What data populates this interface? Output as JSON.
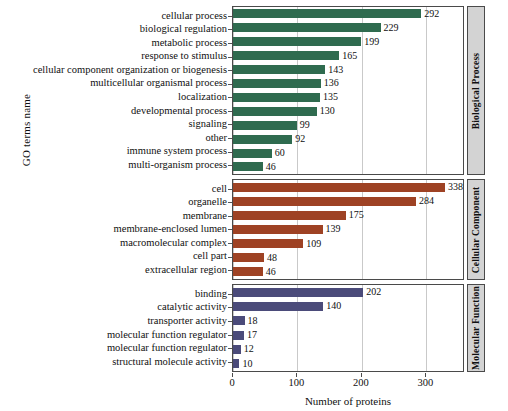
{
  "chart_data": {
    "type": "bar",
    "orientation": "horizontal",
    "title": "",
    "xlabel": "Number of proteins",
    "ylabel": "GO terms name",
    "xlim": [
      0,
      360
    ],
    "xticks": [
      0,
      100,
      200,
      300
    ],
    "grid": true,
    "legend_position": "right-strip",
    "panels": [
      {
        "name": "Biological Process",
        "color": "#2f6b4f",
        "categories": [
          "cellular process",
          "biological regulation",
          "metabolic process",
          "response to stimulus",
          "cellular component organization or biogenesis",
          "multicellular organismal process",
          "localization",
          "developmental process",
          "signaling",
          "other",
          "immune system process",
          "multi-organism process"
        ],
        "values": [
          292,
          229,
          199,
          165,
          143,
          136,
          135,
          130,
          99,
          92,
          60,
          46
        ]
      },
      {
        "name": "Cellular Component",
        "color": "#9e4224",
        "categories": [
          "cell",
          "organelle",
          "membrane",
          "membrane-enclosed lumen",
          "macromolecular complex",
          "cell part",
          "extracellular region"
        ],
        "values": [
          338,
          284,
          175,
          139,
          109,
          48,
          46
        ]
      },
      {
        "name": "Molecular Function",
        "color": "#4b4b7a",
        "categories": [
          "binding",
          "catalytic activity",
          "transporter activity",
          "molecular function regulator",
          "molecular function regulator",
          "structural molecule activity"
        ],
        "values": [
          202,
          140,
          18,
          17,
          12,
          10
        ]
      }
    ]
  }
}
